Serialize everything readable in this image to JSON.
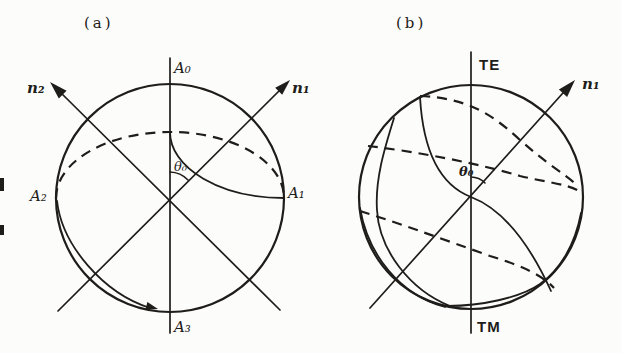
{
  "figure": {
    "colors": {
      "ink": "#1f1d1a",
      "background": "#fcfcfa"
    },
    "panel_a": {
      "title": "(a)",
      "labels": {
        "top_pole": "A₀",
        "right_point": "A₁",
        "left_point": "A₂",
        "bottom_pole": "A₃",
        "axis_n1": "n₁",
        "axis_n2": "n₂",
        "angle": "θ₀"
      }
    },
    "panel_b": {
      "title": "(b)",
      "labels": {
        "top_pole": "TE",
        "bottom_pole": "TM",
        "axis_n1": "n₁",
        "angle": "θ₀"
      }
    }
  }
}
